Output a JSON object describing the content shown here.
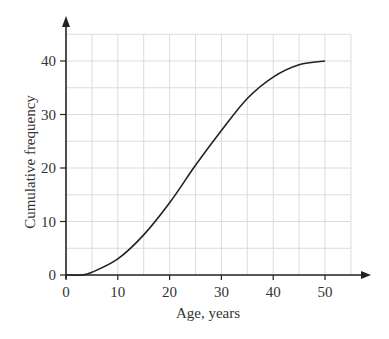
{
  "chart_data": {
    "type": "line",
    "title": "",
    "xlabel": "Age, years",
    "ylabel": "Cumulative frequency",
    "xlim": [
      0,
      55
    ],
    "ylim": [
      0,
      45
    ],
    "x_ticks": [
      0,
      10,
      20,
      30,
      40,
      50
    ],
    "y_ticks": [
      0,
      10,
      20,
      30,
      40
    ],
    "grid": true,
    "grid_step": 5,
    "legend": null,
    "series": [
      {
        "name": "Cumulative frequency",
        "x": [
          0,
          3,
          5,
          10,
          15,
          20,
          25,
          30,
          35,
          40,
          45,
          50
        ],
        "y": [
          0,
          0,
          0.5,
          3,
          7.5,
          13.5,
          20.5,
          27,
          33,
          37,
          39.3,
          40
        ]
      }
    ]
  },
  "colors": {
    "axis": "#222222",
    "grid": "#dcdcdc",
    "curve": "#222222"
  }
}
